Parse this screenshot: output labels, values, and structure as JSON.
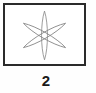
{
  "figure": {
    "caption": "2",
    "frame": {
      "border_color": "#2b2b2b",
      "background_color": "#ffffff"
    },
    "drawing": {
      "name": "six-pointed-asterisk",
      "stroke_color": "#8a8a8a",
      "description": "Three overlapping narrow lens shapes forming a six-pointed asterisk",
      "petals": [
        {
          "label": "vertical-lens",
          "rotation_deg": 0
        },
        {
          "label": "diagonal-lens-right",
          "rotation_deg": 60
        },
        {
          "label": "diagonal-lens-left",
          "rotation_deg": -60
        }
      ]
    }
  }
}
